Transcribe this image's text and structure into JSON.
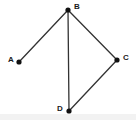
{
  "figure": {
    "type": "node-link-diagram",
    "width": 136,
    "height": 120,
    "background_color": "#ffffff",
    "bottom_band_color": "#f2f2f2",
    "edge_color": "#333333",
    "vertex_color": "#111111",
    "label_color": "#1a1a1a",
    "edge_width": 1.3,
    "vertex_radius": 2.6
  },
  "vertices": [
    {
      "id": "A",
      "label": "A",
      "x": 19,
      "y": 62,
      "label_x": 8,
      "label_y": 56
    },
    {
      "id": "B",
      "label": "B",
      "x": 68,
      "y": 10,
      "label_x": 74,
      "label_y": 3
    },
    {
      "id": "C",
      "label": "C",
      "x": 117,
      "y": 60,
      "label_x": 123,
      "label_y": 54
    },
    {
      "id": "D",
      "label": "D",
      "x": 69,
      "y": 111,
      "label_x": 57,
      "label_y": 105
    }
  ],
  "edges": [
    {
      "id": "AB",
      "from": "A",
      "to": "B",
      "x1": 19,
      "y1": 62,
      "x2": 68,
      "y2": 10
    },
    {
      "id": "BC",
      "from": "B",
      "to": "C",
      "x1": 68,
      "y1": 10,
      "x2": 117,
      "y2": 60
    },
    {
      "id": "BD",
      "from": "B",
      "to": "D",
      "x1": 68,
      "y1": 10,
      "x2": 69,
      "y2": 111
    },
    {
      "id": "CD",
      "from": "C",
      "to": "D",
      "x1": 117,
      "y1": 60,
      "x2": 69,
      "y2": 111
    }
  ]
}
